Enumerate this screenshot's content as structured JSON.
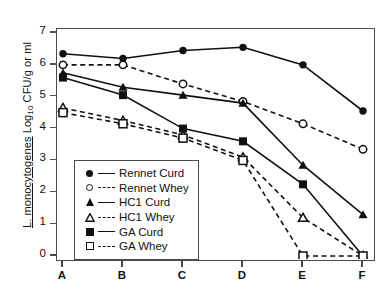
{
  "chart_data": {
    "type": "line",
    "title": "",
    "xlabel": "",
    "ylabel": "L. monocytogenes Log10 CFU/g or ml",
    "ylabel_parts": {
      "italic": "L. monocytogenes",
      "rest_before_sub": " Log",
      "subscript": "10",
      "rest_after_sub": " CFU/g or ml"
    },
    "categories": [
      "A",
      "B",
      "C",
      "D",
      "E",
      "F"
    ],
    "x": [
      "A",
      "B",
      "C",
      "D",
      "E",
      "F"
    ],
    "ylim": [
      0,
      7
    ],
    "yticks": [
      0,
      1,
      2,
      3,
      4,
      5,
      6,
      7
    ],
    "ytick_labels": [
      "0",
      "1",
      "2",
      "3",
      "4",
      "5",
      "6",
      "7"
    ],
    "grid": false,
    "legend_position": "lower-left-inside",
    "series": [
      {
        "name": "Rennet Curd",
        "marker": "filled-circle",
        "linestyle": "solid",
        "color": "#111111",
        "values": [
          6.35,
          6.2,
          6.45,
          6.55,
          6.0,
          4.55
        ]
      },
      {
        "name": "Rennet Whey",
        "marker": "open-circle",
        "linestyle": "dashed",
        "color": "#111111",
        "values": [
          6.0,
          6.0,
          5.4,
          4.85,
          4.15,
          3.35
        ]
      },
      {
        "name": "HC1 Curd",
        "marker": "filled-triangle",
        "linestyle": "solid",
        "color": "#111111",
        "values": [
          5.75,
          5.3,
          5.05,
          4.8,
          2.85,
          1.3
        ]
      },
      {
        "name": "HC1 Whey",
        "marker": "open-triangle",
        "linestyle": "dashed",
        "color": "#111111",
        "values": [
          4.65,
          4.25,
          3.8,
          3.1,
          1.2,
          0.0
        ]
      },
      {
        "name": "GA Curd",
        "marker": "filled-square",
        "linestyle": "solid",
        "color": "#111111",
        "values": [
          5.6,
          5.05,
          4.0,
          3.6,
          2.25,
          0.0
        ]
      },
      {
        "name": "GA Whey",
        "marker": "open-square",
        "linestyle": "dashed",
        "color": "#111111",
        "values": [
          4.5,
          4.15,
          3.7,
          3.0,
          0.0,
          0.0
        ]
      }
    ]
  },
  "legend": {
    "entries": [
      {
        "label": "Rennet Curd",
        "marker": "filled-circle",
        "linestyle": "solid"
      },
      {
        "label": "Rennet Whey",
        "marker": "open-circle",
        "linestyle": "dashed"
      },
      {
        "label": "HC1 Curd",
        "marker": "filled-triangle",
        "linestyle": "solid"
      },
      {
        "label": "HC1 Whey",
        "marker": "open-triangle",
        "linestyle": "dashed"
      },
      {
        "label": "GA Curd",
        "marker": "filled-square",
        "linestyle": "solid"
      },
      {
        "label": "GA Whey",
        "marker": "open-square",
        "linestyle": "dashed"
      }
    ]
  }
}
